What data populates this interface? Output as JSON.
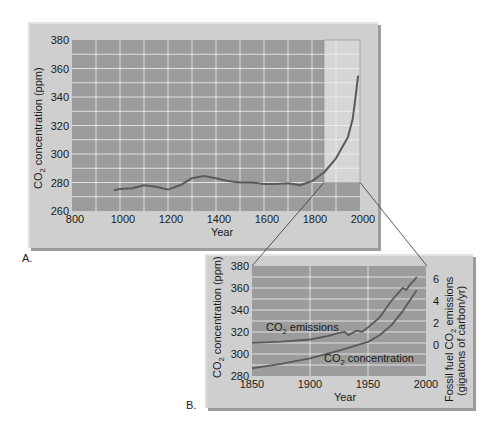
{
  "colors": {
    "panel_bg": "#cfcfcf",
    "plot_bg": "#9c9c9c",
    "highlight_bg": "#d6d6d6",
    "grid": "#f2f2f2",
    "curve": "#5a5a5a",
    "connector": "#333333"
  },
  "panel_a": {
    "label": "A.",
    "xlabel": "Year",
    "ylabel_prefix": "CO",
    "ylabel_sub": "2",
    "ylabel_suffix": " concentration (ppm)",
    "xticks": [
      "800",
      "1000",
      "1200",
      "1400",
      "1600",
      "1800",
      "2000"
    ],
    "yticks": [
      "260",
      "280",
      "300",
      "320",
      "340",
      "360",
      "380"
    ]
  },
  "panel_b": {
    "label": "B.",
    "xlabel": "Year",
    "ylabel_left_prefix": "CO",
    "ylabel_left_sub": "2",
    "ylabel_left_suffix": " concentration (ppm)",
    "ylabel_right_line1_prefix": "Fossil fuel CO",
    "ylabel_right_line1_sub": "2",
    "ylabel_right_line1_suffix": " emissions",
    "ylabel_right_line2": "(gigatons of carbon/yr)",
    "xticks": [
      "1850",
      "1900",
      "1950",
      "2000"
    ],
    "yticks_left": [
      "280",
      "300",
      "320",
      "340",
      "360",
      "380"
    ],
    "yticks_right": [
      "0",
      "2",
      "4",
      "6"
    ],
    "emissions_label_prefix": "CO",
    "emissions_label_sub": "2",
    "emissions_label_suffix": " emissions",
    "concentration_label_prefix": "CO",
    "concentration_label_sub": "2",
    "concentration_label_suffix": " concentration"
  },
  "chart_data": [
    {
      "type": "line",
      "title": "",
      "panel": "A",
      "xlabel": "Year",
      "ylabel": "CO2 concentration (ppm)",
      "xlim": [
        800,
        2000
      ],
      "ylim": [
        260,
        380
      ],
      "grid": true,
      "highlight_region": {
        "x": [
          1850,
          2000
        ],
        "y": [
          280,
          380
        ]
      },
      "series": [
        {
          "name": "CO2 concentration",
          "x": [
            975,
            1000,
            1050,
            1100,
            1150,
            1200,
            1250,
            1300,
            1350,
            1400,
            1450,
            1500,
            1550,
            1600,
            1650,
            1700,
            1750,
            1800,
            1850,
            1900,
            1950,
            1970,
            1980,
            1992
          ],
          "y": [
            274.5,
            275.5,
            276,
            278,
            277,
            275,
            278,
            283,
            284.5,
            283,
            281,
            280,
            280,
            279,
            279,
            279.5,
            278,
            281,
            287,
            297,
            312,
            325,
            338,
            355
          ]
        }
      ]
    },
    {
      "type": "line",
      "title": "",
      "panel": "B",
      "xlabel": "Year",
      "ylabel": "CO2 concentration (ppm)",
      "ylabel_right": "Fossil fuel CO2 emissions (gigatons of carbon/yr)",
      "xlim": [
        1850,
        2000
      ],
      "ylim": [
        280,
        380
      ],
      "ylim_right": [
        0,
        6
      ],
      "grid": true,
      "series": [
        {
          "name": "CO2 emissions",
          "axis": "right",
          "x": [
            1850,
            1875,
            1900,
            1915,
            1925,
            1930,
            1933,
            1940,
            1945,
            1950,
            1960,
            1970,
            1975,
            1980,
            1983,
            1987,
            1990,
            1992
          ],
          "y": [
            0.2,
            0.3,
            0.5,
            0.8,
            1.1,
            1.2,
            0.9,
            1.3,
            1.2,
            1.6,
            2.5,
            4.0,
            4.6,
            5.2,
            5.0,
            5.6,
            5.9,
            6.2
          ]
        },
        {
          "name": "CO2 concentration",
          "axis": "left",
          "x": [
            1850,
            1875,
            1900,
            1925,
            1950,
            1960,
            1970,
            1980,
            1992
          ],
          "y": [
            287,
            291,
            296,
            303,
            311,
            317,
            326,
            339,
            358
          ]
        }
      ]
    }
  ]
}
